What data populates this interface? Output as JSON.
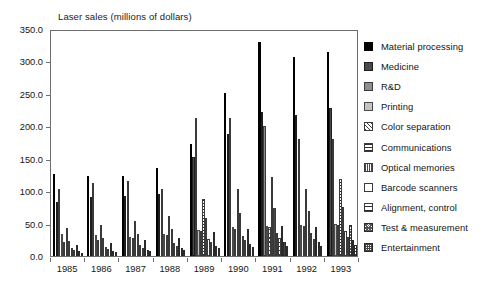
{
  "chart_data": {
    "type": "bar",
    "title": "Laser sales (millions of dollars)",
    "xlabel": "",
    "ylabel": "",
    "ylim": [
      0,
      350
    ],
    "ytick_step": 50,
    "ytick_labels": [
      "0.0",
      "50.0",
      "100.0",
      "150.0",
      "200.0",
      "250.0",
      "300.0",
      "350.0"
    ],
    "grid": false,
    "legend_position": "right",
    "categories": [
      "1985",
      "1986",
      "1987",
      "1988",
      "1989",
      "1990",
      "1991",
      "1992",
      "1993"
    ],
    "series": [
      {
        "name": "Material processing",
        "fill": "solid-black",
        "color": "#000000",
        "values": [
          127,
          123,
          124,
          135,
          173,
          251,
          330,
          307,
          314
        ]
      },
      {
        "name": "Medicine",
        "fill": "dark-gray",
        "color": "#4a4a4a",
        "values": [
          83,
          91,
          93,
          95,
          152,
          188,
          222,
          217,
          228
        ]
      },
      {
        "name": "R&D",
        "fill": "medium-gray",
        "color": "#8e8e8e",
        "values": [
          103,
          113,
          116,
          104,
          213,
          213,
          200,
          180,
          181
        ]
      },
      {
        "name": "Printing",
        "fill": "light-gray",
        "color": "#c4c4c4",
        "values": [
          34,
          32,
          30,
          34,
          40,
          44,
          47,
          48,
          50
        ]
      },
      {
        "name": "Color separation",
        "fill": "diag-hatch",
        "color": "#ffffff",
        "values": [
          21,
          24,
          28,
          33,
          38,
          41,
          45,
          46,
          48
        ]
      },
      {
        "name": "Communications",
        "fill": "horiz-lines",
        "color": "#ffffff",
        "values": [
          43,
          48,
          54,
          62,
          88,
          103,
          122,
          104,
          119
        ]
      },
      {
        "name": "Optical memories",
        "fill": "vert-lines",
        "color": "#ffffff",
        "values": [
          23,
          28,
          34,
          42,
          59,
          66,
          74,
          70,
          76
        ]
      },
      {
        "name": "Barcode scanners",
        "fill": "white",
        "color": "#ffffff",
        "values": [
          12,
          14,
          17,
          20,
          27,
          31,
          36,
          35,
          38
        ]
      },
      {
        "name": "Alignment, control",
        "fill": "horiz-sparse",
        "color": "#ffffff",
        "values": [
          9,
          11,
          13,
          16,
          22,
          25,
          28,
          27,
          30
        ]
      },
      {
        "name": "Test & measurement",
        "fill": "dense-diag",
        "color": "#ffffff",
        "values": [
          17,
          20,
          24,
          28,
          37,
          42,
          47,
          44,
          48
        ]
      },
      {
        "name": "Entertainment",
        "fill": "checker",
        "color": "#ffffff",
        "values": [
          7,
          8,
          10,
          12,
          16,
          19,
          22,
          21,
          24
        ]
      },
      {
        "name": "Other",
        "fill": "grid-lines",
        "color": "#ffffff",
        "values": [
          5,
          6,
          7,
          9,
          12,
          14,
          16,
          15,
          17
        ]
      }
    ]
  },
  "legend": {
    "items": [
      {
        "label": "Material processing",
        "fill": "solid-black"
      },
      {
        "label": "Medicine",
        "fill": "dark-gray"
      },
      {
        "label": "R&D",
        "fill": "medium-gray"
      },
      {
        "label": "Printing",
        "fill": "light-gray"
      },
      {
        "label": "Color separation",
        "fill": "diag-hatch"
      },
      {
        "label": "Communications",
        "fill": "horiz-lines"
      },
      {
        "label": "Optical memories",
        "fill": "vert-lines"
      },
      {
        "label": "Barcode scanners",
        "fill": "white"
      },
      {
        "label": "Alignment, control",
        "fill": "horiz-sparse"
      },
      {
        "label": "Test & measurement",
        "fill": "dense-diag"
      },
      {
        "label": "Entertainment",
        "fill": "checker"
      }
    ]
  }
}
